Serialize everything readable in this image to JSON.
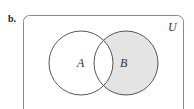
{
  "part_label": "b.",
  "universe_label": "U",
  "sets": [
    {
      "label": "A",
      "cx": 81,
      "cy": 63,
      "r": 32,
      "shaded": false
    },
    {
      "label": "B",
      "cx": 126,
      "cy": 63,
      "r": 32,
      "shaded": true
    }
  ],
  "shaded_region": "B minus A",
  "colors": {
    "shade": "#e4e4e4",
    "stroke": "#555555",
    "border": "#8a8a8a"
  }
}
